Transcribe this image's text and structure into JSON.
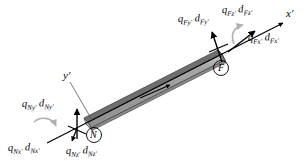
{
  "figure": {
    "background_color": "#ffffff",
    "beam": {
      "fill_color": "#9a9a9a",
      "top_edge_color": "#6d6d6d",
      "outline_color": "#3a3a3a"
    },
    "arrow_color": "#000000",
    "moment_arrow_color": "#b4b4b4"
  },
  "axes": [
    {
      "name": "x-prime-axis",
      "label": "x′"
    },
    {
      "name": "y-prime-axis",
      "label": "y′"
    }
  ],
  "nodes": [
    {
      "name": "node-N",
      "label": "N"
    },
    {
      "name": "node-F",
      "label": "F"
    }
  ],
  "labels": {
    "near_end": {
      "qNy": {
        "q": "q",
        "q_sub": "N y′",
        "d": "d",
        "d_sub": "N y′"
      },
      "qNx": {
        "q": "q",
        "q_sub": "N x′",
        "d": "d",
        "d_sub": "N x′"
      },
      "qNz": {
        "q": "q",
        "q_sub": "N z′",
        "d": "d",
        "d_sub": "N z′"
      }
    },
    "far_end": {
      "qFy": {
        "q": "q",
        "q_sub": "F y′",
        "d": "d",
        "d_sub": "F y′"
      },
      "qFz": {
        "q": "q",
        "q_sub": "F z′",
        "d": "d",
        "d_sub": "F z′"
      },
      "qFx": {
        "q": "q",
        "q_sub": "F x′",
        "d": "d",
        "d_sub": "F x′"
      }
    }
  },
  "label_text": {
    "qNy_full": "q",
    "qNy_q_sub": "Ny′",
    "qNy_d": "d",
    "qNy_d_sub": "Ny′",
    "qNx_q": "q",
    "qNx_q_sub": "Nx′",
    "qNx_d": "d",
    "qNx_d_sub": "Nx′",
    "qNz_q": "q",
    "qNz_q_sub": "Nz′",
    "qNz_d": "d",
    "qNz_d_sub": "Nz′",
    "qFy_q": "q",
    "qFy_q_sub": "Fy′",
    "qFy_d": "d",
    "qFy_d_sub": "Fy′",
    "qFz_q": "q",
    "qFz_q_sub": "Fz′",
    "qFz_d": "d",
    "qFz_d_sub": "Fz′",
    "qFx_q": "q",
    "qFx_q_sub": "Fx′",
    "qFx_d": "d",
    "qFx_d_sub": "Fx′",
    "x_axis": "x′",
    "y_axis": "y′",
    "node_N": "N",
    "node_F": "F"
  }
}
